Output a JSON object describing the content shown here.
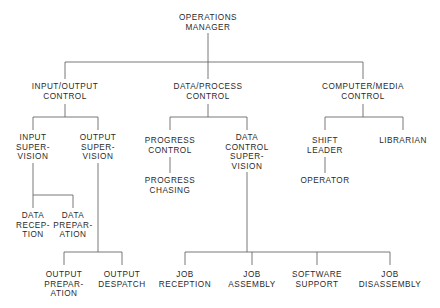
{
  "chart": {
    "line_color": "#6a6a6a",
    "text_color": "#2a2a2a",
    "nodes": {
      "operations_manager": {
        "lines": [
          "OPERATIONS",
          "MANAGER"
        ]
      },
      "io_control": {
        "lines": [
          "INPUT/OUTPUT",
          "CONTROL"
        ]
      },
      "data_process_control": {
        "lines": [
          "DATA/PROCESS",
          "CONTROL"
        ]
      },
      "computer_media_control": {
        "lines": [
          "COMPUTER/MEDIA",
          "CONTROL"
        ]
      },
      "input_supervision": {
        "lines": [
          "INPUT",
          "SUPER-",
          "VISION"
        ]
      },
      "output_supervision": {
        "lines": [
          "OUTPUT",
          "SUPER-",
          "VISION"
        ]
      },
      "progress_control": {
        "lines": [
          "PROGRESS",
          "CONTROL"
        ]
      },
      "progress_chasing": {
        "lines": [
          "PROGRESS",
          "CHASING"
        ]
      },
      "data_control_supervision": {
        "lines": [
          "DATA",
          "CONTROL",
          "SUPER-",
          "VISION"
        ]
      },
      "shift_leader": {
        "lines": [
          "SHIFT",
          "LEADER"
        ]
      },
      "librarian": {
        "lines": [
          "LIBRARIAN"
        ]
      },
      "operator": {
        "lines": [
          "OPERATOR"
        ]
      },
      "data_reception": {
        "lines": [
          "DATA",
          "RECEP-",
          "TION"
        ]
      },
      "data_preparation": {
        "lines": [
          "DATA",
          "PREPAR-",
          "ATION"
        ]
      },
      "output_preparation": {
        "lines": [
          "OUTPUT",
          "PREPAR-",
          "ATION"
        ]
      },
      "output_despatch": {
        "lines": [
          "OUTPUT",
          "DESPATCH"
        ]
      },
      "job_reception": {
        "lines": [
          "JOB",
          "RECEPTION"
        ]
      },
      "job_assembly": {
        "lines": [
          "JOB",
          "ASSEMBLY"
        ]
      },
      "software_support": {
        "lines": [
          "SOFTWARE",
          "SUPPORT"
        ]
      },
      "job_disassembly": {
        "lines": [
          "JOB",
          "DISASSEMBLY"
        ]
      }
    },
    "hierarchy": {
      "OPERATIONS MANAGER": {
        "INPUT/OUTPUT CONTROL": {
          "INPUT SUPERVISION": [
            "DATA RECEPTION",
            "DATA PREPARATION"
          ],
          "OUTPUT SUPERVISION": [
            "OUTPUT PREPARATION",
            "OUTPUT DESPATCH"
          ]
        },
        "DATA/PROCESS CONTROL": {
          "PROGRESS CONTROL": [
            "PROGRESS CHASING"
          ],
          "DATA CONTROL SUPERVISION": [
            "JOB RECEPTION",
            "JOB ASSEMBLY",
            "SOFTWARE SUPPORT",
            "JOB DISASSEMBLY"
          ]
        },
        "COMPUTER/MEDIA CONTROL": {
          "SHIFT LEADER": [
            "OPERATOR"
          ],
          "LIBRARIAN": []
        }
      }
    }
  }
}
